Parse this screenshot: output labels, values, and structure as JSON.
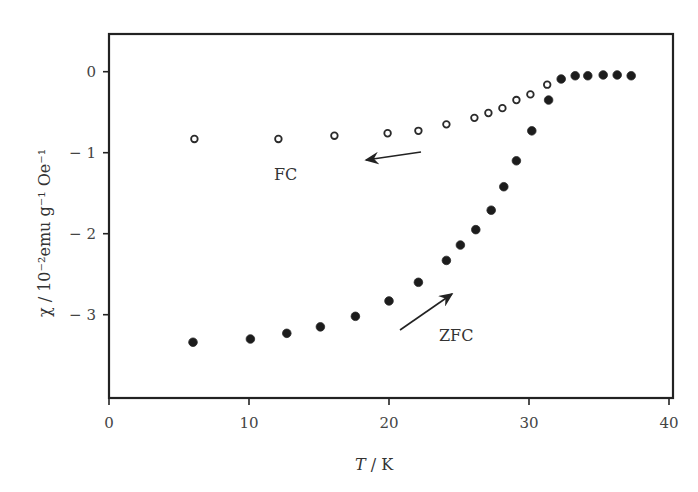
{
  "chart_data": {
    "type": "scatter",
    "title": "",
    "xlabel": "T / K",
    "ylabel": "χ / 10⁻²emu g⁻¹ Oe⁻¹",
    "xlim": [
      0,
      40
    ],
    "ylim": [
      -3.9,
      0.45
    ],
    "xticks": [
      0,
      10,
      20,
      30,
      40
    ],
    "yticks": [
      0,
      -1,
      -2,
      -3
    ],
    "grid": false,
    "legend": null,
    "series": [
      {
        "name": "FC",
        "marker": "open-circle",
        "x": [
          6.1,
          12.1,
          16.1,
          19.9,
          22.1,
          24.1,
          26.1,
          27.1,
          28.1,
          29.1,
          30.1,
          31.3
        ],
        "y": [
          -0.83,
          -0.83,
          -0.79,
          -0.76,
          -0.73,
          -0.65,
          -0.57,
          -0.51,
          -0.45,
          -0.35,
          -0.28,
          -0.16
        ]
      },
      {
        "name": "ZFC",
        "marker": "filled-circle",
        "x": [
          6.0,
          10.1,
          12.7,
          15.1,
          17.6,
          20.0,
          22.1,
          24.1,
          25.1,
          26.2,
          27.3,
          28.2,
          29.1,
          30.2,
          31.4,
          32.3,
          33.3,
          34.2,
          35.3,
          36.3,
          37.3
        ],
        "y": [
          -3.34,
          -3.3,
          -3.23,
          -3.15,
          -3.02,
          -2.83,
          -2.6,
          -2.33,
          -2.14,
          -1.95,
          -1.71,
          -1.42,
          -1.1,
          -0.73,
          -0.35,
          -0.09,
          -0.05,
          -0.05,
          -0.04,
          -0.04,
          -0.05
        ]
      }
    ],
    "annotations": [
      {
        "text": "FC",
        "x": 12.3,
        "y": -1.26,
        "arrow_from": [
          22.3,
          -0.99
        ],
        "arrow_to": [
          18.4,
          -1.09
        ]
      },
      {
        "text": "ZFC",
        "x": 23.6,
        "y": -3.26,
        "arrow_from": [
          20.8,
          -3.19
        ],
        "arrow_to": [
          24.5,
          -2.74
        ]
      }
    ]
  },
  "axes": {
    "x_title_italic": "T",
    "x_title_rest": " / K",
    "y_title": "χ / 10⁻²emu g⁻¹ Oe⁻¹",
    "x_tick_labels": [
      "0",
      "10",
      "20",
      "30",
      "40"
    ],
    "y_tick_labels": [
      "0",
      "− 1",
      "− 2",
      "− 3"
    ]
  },
  "labels": {
    "fc": "FC",
    "zfc": "ZFC"
  }
}
